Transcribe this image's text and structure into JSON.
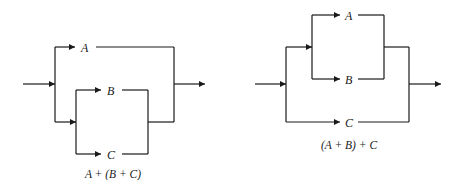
{
  "diagrams": [
    {
      "name": "A parallel with (B parallel C)",
      "caption": "A + (B + C)",
      "labels": {
        "a": "A",
        "b": "B",
        "c": "C"
      }
    },
    {
      "name": "(A parallel B) parallel C",
      "caption": "(A + B) + C",
      "labels": {
        "a": "A",
        "b": "B",
        "c": "C"
      }
    }
  ],
  "colors": {
    "line": "#1a1a1a",
    "background": "#ffffff"
  }
}
